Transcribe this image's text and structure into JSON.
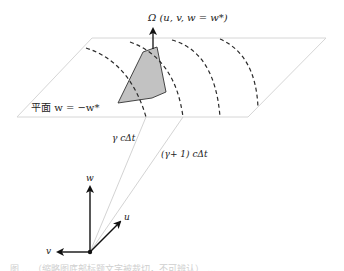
{
  "figure": {
    "top_label": "Ω (u, v, w = w*)",
    "plane_label": "平面 w = −w*",
    "distance_label_1": "γ cΔt",
    "distance_label_2": "(γ+ 1)  cΔt",
    "axes": {
      "w": "w",
      "u": "u",
      "v": "v"
    },
    "caption": "图 ... （缩略图底部标题文字被裁切，不可辨认） ..."
  },
  "colors": {
    "plane_edge": "#d6d6d6",
    "polygon_fill": "#c2c2c2",
    "polygon_edge": "#333333",
    "dashes": "#2a2a2a",
    "rays": "#c8c8c8",
    "axes": "#111111"
  },
  "geometry": {
    "plane": [
      [
        92,
        38
      ],
      [
        326,
        38
      ],
      [
        248,
        117
      ],
      [
        17,
        117
      ]
    ],
    "polygon": [
      [
        118,
        103
      ],
      [
        143,
        52
      ],
      [
        157,
        47
      ],
      [
        166,
        92
      ],
      [
        152,
        98
      ]
    ],
    "origin": [
      90,
      252
    ],
    "ray_ends": [
      [
        146,
        117
      ],
      [
        183,
        117
      ]
    ]
  }
}
